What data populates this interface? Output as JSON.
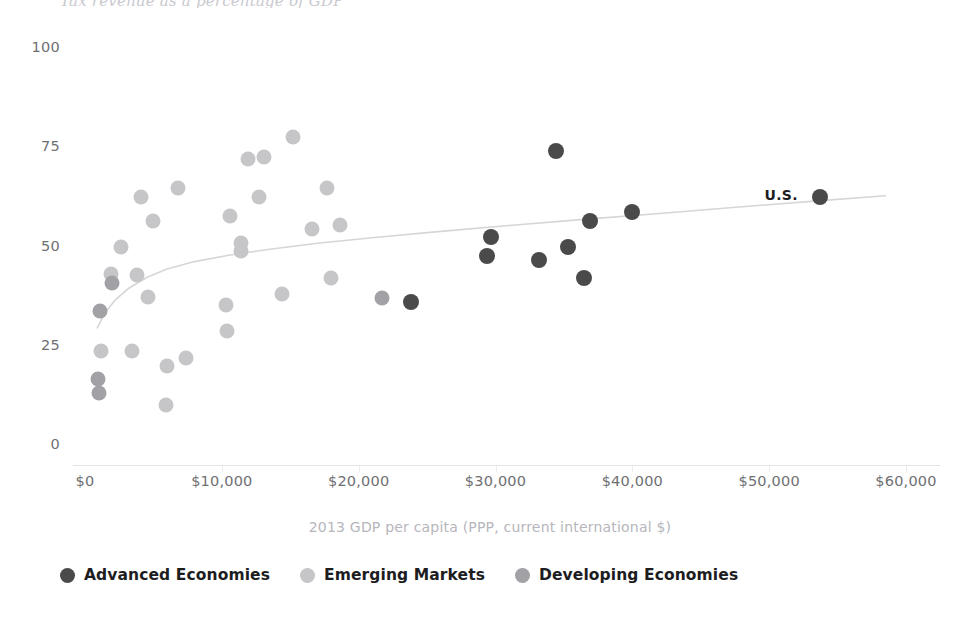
{
  "chart_data": {
    "type": "scatter",
    "title": "Tax revenue as a percentage of GDP",
    "xlabel": "2013 GDP per capita (PPP, current international $)",
    "ylabel": "",
    "xlim": [
      0,
      62000
    ],
    "ylim": [
      0,
      100
    ],
    "xticks": [
      0,
      10000,
      20000,
      30000,
      40000,
      50000,
      60000
    ],
    "xticklabels": [
      "$0",
      "$10,000",
      "$20,000",
      "$30,000",
      "$40,000",
      "$50,000",
      "$60,000"
    ],
    "yticks": [
      0,
      25,
      50,
      75,
      100
    ],
    "yticklabels": [
      "0",
      "25",
      "50",
      "75",
      "100"
    ],
    "grid": false,
    "legend_position": "bottom-left",
    "colors": {
      "advanced": "#4a4a4a",
      "emerging": "#c6c6c9",
      "developing": "#a2a2a6",
      "trendline": "#d6d6da",
      "axis": "#e3e3e6",
      "tick_text": "#6f6f72",
      "axis_title": "#b6b6bc",
      "annotation": "#1d1d1f"
    },
    "legend": [
      {
        "name": "Advanced Economies",
        "color_key": "advanced",
        "swatch": "#4a4a4a"
      },
      {
        "name": "Emerging Markets",
        "color_key": "emerging",
        "swatch": "#c6c6c9"
      },
      {
        "name": "Developing Economies",
        "color_key": "developing",
        "swatch": "#a2a2a6"
      }
    ],
    "annotations": [
      {
        "text": "U.S.",
        "x": 53700,
        "y": 62.5,
        "dx": -22,
        "dy": -2
      }
    ],
    "trendline": {
      "name": "logarithmic fit",
      "points": [
        [
          900,
          29.5
        ],
        [
          1400,
          33.0
        ],
        [
          2200,
          36.5
        ],
        [
          3200,
          39.5
        ],
        [
          4500,
          42.2
        ],
        [
          6000,
          44.3
        ],
        [
          8000,
          46.2
        ],
        [
          10500,
          47.8
        ],
        [
          13500,
          49.3
        ],
        [
          17000,
          50.8
        ],
        [
          21000,
          52.2
        ],
        [
          26000,
          53.8
        ],
        [
          31000,
          55.3
        ],
        [
          36000,
          56.7
        ],
        [
          42000,
          58.3
        ],
        [
          48000,
          60.0
        ],
        [
          54000,
          61.6
        ],
        [
          58500,
          62.8
        ]
      ]
    },
    "series": [
      {
        "name": "Advanced Economies",
        "color": "#4a4a4a",
        "radius": 8,
        "points": [
          {
            "x": 34400,
            "y": 74.0
          },
          {
            "x": 29700,
            "y": 52.5
          },
          {
            "x": 29400,
            "y": 47.5
          },
          {
            "x": 33200,
            "y": 46.5
          },
          {
            "x": 35300,
            "y": 50.0
          },
          {
            "x": 36900,
            "y": 56.5
          },
          {
            "x": 36500,
            "y": 42.0
          },
          {
            "x": 40000,
            "y": 58.8
          },
          {
            "x": 23800,
            "y": 36.0
          },
          {
            "x": 53700,
            "y": 62.5
          }
        ]
      },
      {
        "name": "Emerging Markets",
        "color": "#c6c6c9",
        "radius": 7.5,
        "points": [
          {
            "x": 15200,
            "y": 77.5
          },
          {
            "x": 11900,
            "y": 72.0
          },
          {
            "x": 13100,
            "y": 72.5
          },
          {
            "x": 6800,
            "y": 64.8
          },
          {
            "x": 4100,
            "y": 62.5
          },
          {
            "x": 12700,
            "y": 62.5
          },
          {
            "x": 17700,
            "y": 64.8
          },
          {
            "x": 5000,
            "y": 56.3
          },
          {
            "x": 10600,
            "y": 57.8
          },
          {
            "x": 16600,
            "y": 54.5
          },
          {
            "x": 18600,
            "y": 55.5
          },
          {
            "x": 2600,
            "y": 49.8
          },
          {
            "x": 11400,
            "y": 48.8
          },
          {
            "x": 11400,
            "y": 50.8
          },
          {
            "x": 1900,
            "y": 43.0
          },
          {
            "x": 3800,
            "y": 42.8
          },
          {
            "x": 4600,
            "y": 37.2
          },
          {
            "x": 18000,
            "y": 42.0
          },
          {
            "x": 10300,
            "y": 35.3
          },
          {
            "x": 14400,
            "y": 38.0
          },
          {
            "x": 10400,
            "y": 28.8
          },
          {
            "x": 1200,
            "y": 23.8
          },
          {
            "x": 3400,
            "y": 23.8
          },
          {
            "x": 6000,
            "y": 20.0
          },
          {
            "x": 7400,
            "y": 21.8
          },
          {
            "x": 5900,
            "y": 10.0
          }
        ]
      },
      {
        "name": "Developing Economies",
        "color": "#a2a2a6",
        "radius": 7.5,
        "points": [
          {
            "x": 1100,
            "y": 33.8
          },
          {
            "x": 2000,
            "y": 40.8
          },
          {
            "x": 21700,
            "y": 37.0
          },
          {
            "x": 950,
            "y": 16.5
          },
          {
            "x": 1050,
            "y": 13.0
          }
        ]
      }
    ]
  }
}
